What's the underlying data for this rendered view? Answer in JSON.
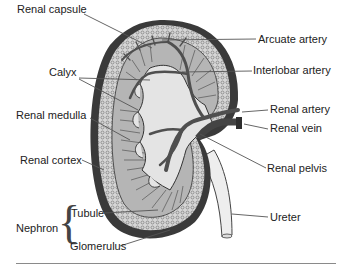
{
  "figure": {
    "labels": {
      "renal_capsule": "Renal capsule",
      "calyx": "Calyx",
      "renal_medulla": "Renal medulla",
      "renal_cortex": "Renal cortex",
      "nephron": "Nephron",
      "tubule": "Tubule",
      "glomerulus": "Glomerulus",
      "arcuate_artery": "Arcuate artery",
      "interlobar_artery": "Interlobar artery",
      "renal_artery": "Renal artery",
      "renal_vein": "Renal vein",
      "renal_pelvis": "Renal pelvis",
      "ureter": "Ureter"
    },
    "colors": {
      "capsule": "#3a3a3a",
      "cortex": "#cfcfcf",
      "medulla": "#a9a9a9",
      "pelvis": "#e4e4e4",
      "vessel": "#5a5a5a",
      "ureter": "#eeeeee",
      "leader": "#555555"
    }
  }
}
